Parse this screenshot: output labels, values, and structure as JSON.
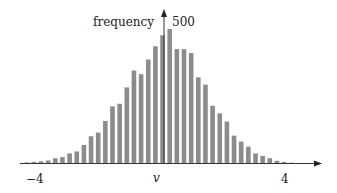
{
  "chart_data": {
    "type": "bar",
    "title": "",
    "xlabel": "v",
    "ylabel": "frequency",
    "x_tick_labels": [
      "-4",
      "4"
    ],
    "x_ticks": [
      -4,
      4
    ],
    "y_tick_labels": [
      "500"
    ],
    "y_ticks": [
      500
    ],
    "xlim": [
      -4.6,
      4.6
    ],
    "ylim": [
      0,
      520
    ],
    "grid": false,
    "legend": null,
    "bar_color": "#8c8c8c",
    "bin_width": 0.2,
    "x": [
      -3.9,
      -3.7,
      -3.5,
      -3.3,
      -3.1,
      -2.9,
      -2.7,
      -2.5,
      -2.3,
      -2.1,
      -1.9,
      -1.7,
      -1.5,
      -1.3,
      -1.1,
      -0.9,
      -0.7,
      -0.5,
      -0.3,
      -0.1,
      0.1,
      0.3,
      0.5,
      0.7,
      0.9,
      1.1,
      1.3,
      1.5,
      1.7,
      1.9,
      2.1,
      2.3,
      2.5,
      2.7,
      2.9,
      3.1,
      3.3,
      3.5
    ],
    "values": [
      2,
      4,
      6,
      9,
      17,
      21,
      34,
      41,
      64,
      95,
      108,
      149,
      201,
      210,
      268,
      328,
      315,
      367,
      414,
      453,
      475,
      404,
      404,
      390,
      304,
      278,
      203,
      176,
      147,
      97,
      76,
      58,
      34,
      25,
      17,
      8,
      4,
      1
    ]
  },
  "labels": {
    "ylabel": "frequency",
    "y_tick": "500",
    "xlabel": "v",
    "x_tick_left": "−4",
    "x_tick_right": "4"
  }
}
